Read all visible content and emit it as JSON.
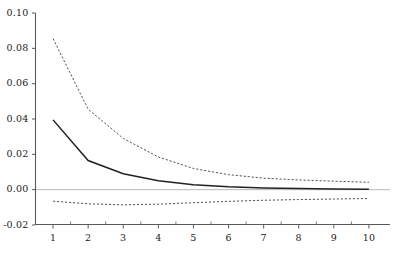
{
  "chart_data": {
    "type": "line",
    "title": "",
    "subtitle": "",
    "xlabel": "",
    "ylabel": "",
    "x": [
      1,
      2,
      3,
      4,
      5,
      6,
      7,
      8,
      9,
      10
    ],
    "xlim": [
      0.5,
      10.6
    ],
    "ylim": [
      -0.02,
      0.1
    ],
    "xtick_labels": [
      "1",
      "2",
      "3",
      "4",
      "5",
      "6",
      "7",
      "8",
      "9",
      "10"
    ],
    "ytick_labels": [
      "0.10",
      "0.08",
      "0.06",
      "0.04",
      "0.02",
      "0.00",
      "-0.02"
    ],
    "ytick_values": [
      0.1,
      0.08,
      0.06,
      0.04,
      0.02,
      0.0,
      -0.02
    ],
    "grid": false,
    "minor_ticks": true,
    "legend_position": "none",
    "zero_reference_line": 0.0,
    "series": [
      {
        "name": "upper-confidence-band",
        "style": "dashed",
        "color": "#555555",
        "values": [
          0.0855,
          0.0455,
          0.029,
          0.0185,
          0.012,
          0.0085,
          0.0065,
          0.0055,
          0.0048,
          0.0042
        ]
      },
      {
        "name": "point-estimate",
        "style": "solid",
        "color": "#222222",
        "values": [
          0.0395,
          0.0165,
          0.009,
          0.005,
          0.0028,
          0.0016,
          0.001,
          0.0006,
          0.0004,
          0.0003
        ]
      },
      {
        "name": "lower-confidence-band",
        "style": "dashed",
        "color": "#555555",
        "values": [
          -0.0065,
          -0.008,
          -0.0086,
          -0.0082,
          -0.0074,
          -0.0066,
          -0.006,
          -0.0056,
          -0.0053,
          -0.005
        ]
      }
    ]
  },
  "axes": {
    "zero_line_color": "#b8b8b8",
    "axis_color": "#5a5a5a"
  }
}
